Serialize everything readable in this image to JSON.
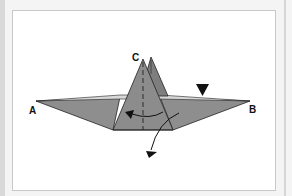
{
  "diagram": {
    "type": "origami-fold-step",
    "labels": {
      "a": "A",
      "b": "B",
      "c": "C"
    },
    "colors": {
      "paper": "#8c8c8c",
      "paper_dark": "#7a7a7a",
      "edge": "#2a2a2a",
      "background": "#ffffff",
      "frame": "#c8c8c8"
    },
    "symbols": [
      "valley-fold-line",
      "push-arrow",
      "rotate-arrow",
      "fold-down-arrow"
    ]
  }
}
